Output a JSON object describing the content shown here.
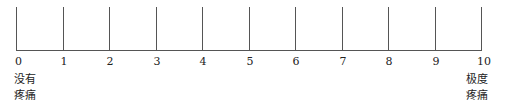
{
  "scale": {
    "min": 0,
    "max": 10,
    "ticks": [
      "0",
      "1",
      "2",
      "3",
      "4",
      "5",
      "6",
      "7",
      "8",
      "9",
      "10"
    ],
    "left_anchor": {
      "line1": "没有",
      "line2": "疼痛"
    },
    "right_anchor": {
      "line1": "极度",
      "line2": "疼痛"
    }
  }
}
